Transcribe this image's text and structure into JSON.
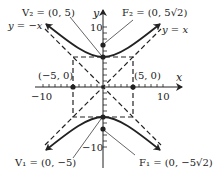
{
  "figure": {
    "type": "hyperbola",
    "equation_hint": "y^2/25 - x^2/25 = 1",
    "axes": {
      "x_label": "x",
      "y_label": "y",
      "x_tick_labels": [
        "−10",
        "10"
      ],
      "y_tick_labels": [
        "10",
        "−10"
      ]
    },
    "points": {
      "v2": "V₂ = (0, 5)",
      "f2": "F₂ = (0, 5√2)",
      "v1": "V₁ = (0, −5)",
      "f1": "F₁ = (0, −5√2)",
      "left": "(−5, 0)",
      "right": "(5, 0)"
    },
    "asymptotes": {
      "neg": "y = −x",
      "pos": "y = x"
    },
    "colors": {
      "ink": "#222222",
      "background": "#ffffff"
    }
  }
}
